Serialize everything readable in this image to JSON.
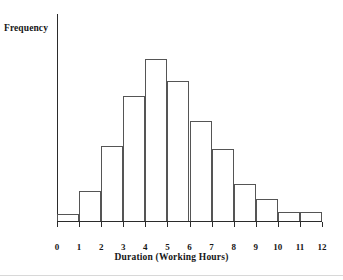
{
  "chart_data": {
    "type": "bar",
    "subtype": "histogram",
    "title": "",
    "xlabel": "Duration (Working Hours)",
    "ylabel": "Frequency",
    "categories": [
      "0-1",
      "1-2",
      "2-3",
      "3-4",
      "4-5",
      "5-6",
      "6-7",
      "7-8",
      "8-9",
      "9-10",
      "10-11",
      "11-12"
    ],
    "bin_edges": [
      0,
      1,
      2,
      3,
      4,
      5,
      6,
      7,
      8,
      9,
      10,
      11,
      12
    ],
    "values": [
      7,
      30,
      75,
      125,
      162,
      140,
      100,
      72,
      37,
      22,
      9,
      9
    ],
    "xtick_labels": [
      "0",
      "1",
      "2",
      "3",
      "4",
      "5",
      "6",
      "7",
      "8",
      "9",
      "10",
      "11",
      "12"
    ],
    "ytick_labels": [],
    "xlim": [
      0,
      12
    ],
    "ylim": [
      0,
      208
    ],
    "grid": false,
    "legend": null,
    "bar_fill_color": "#ffffff",
    "bar_edge_color": "#555555",
    "axis_color": "#2b2b2b",
    "background_color": "#ffffff",
    "text_color": "#161616"
  },
  "labels": {
    "y_axis_title": "Frequency",
    "x_axis_title": "Duration (Working Hours)"
  }
}
